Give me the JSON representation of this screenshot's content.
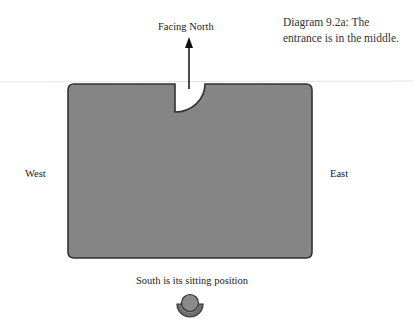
{
  "caption": {
    "line1": "Diagram 9.2a: The",
    "line2": "entrance is in the middle."
  },
  "labels": {
    "north": "Facing North",
    "west": "West",
    "east": "East",
    "south": "South is its sitting position"
  },
  "diagram": {
    "building": {
      "shape": "rounded-rectangle",
      "fill": "#858585",
      "stroke": "#333333",
      "entrance": "quarter-circle notch at top center"
    },
    "arrow": {
      "direction": "north",
      "color": "#111111"
    },
    "sitting_figure": {
      "fill": "#8a8a8a",
      "stroke": "#333333"
    },
    "divider_line_color": "#e6e6e6"
  }
}
